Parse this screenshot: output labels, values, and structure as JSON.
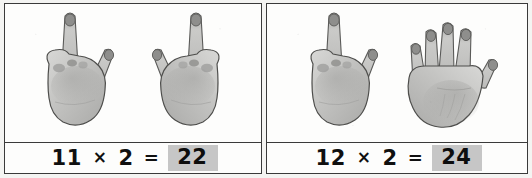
{
  "worksheet": {
    "title": "Multiplication with finger counting",
    "background_color": "#f4f4f2",
    "panel_background": "#fdfdfc",
    "border_color": "#3a3a3a",
    "highlight_color": "#c6c6c6",
    "text_color": "#101010"
  },
  "panels": [
    {
      "id": "panel-left",
      "hands": [
        {
          "name": "hand-photo-one-finger",
          "fingers_up": 1,
          "thumb_out": true,
          "orientation": "right"
        },
        {
          "name": "hand-photo-one-finger",
          "fingers_up": 1,
          "thumb_out": true,
          "orientation": "left"
        }
      ],
      "equation": {
        "left_operand": "11",
        "operator": "×",
        "right_operand": "2",
        "equals": "=",
        "answer": "22",
        "full_text": "11 × 2 = 22"
      }
    },
    {
      "id": "panel-right",
      "hands": [
        {
          "name": "hand-photo-one-finger",
          "fingers_up": 1,
          "thumb_out": true,
          "orientation": "right"
        },
        {
          "name": "hand-photo-four-fingers",
          "fingers_up": 4,
          "thumb_out": true,
          "orientation": "left"
        }
      ],
      "equation": {
        "left_operand": "12",
        "operator": "×",
        "right_operand": "2",
        "equals": "=",
        "answer": "24",
        "full_text": "12 × 2 = 24"
      }
    }
  ]
}
